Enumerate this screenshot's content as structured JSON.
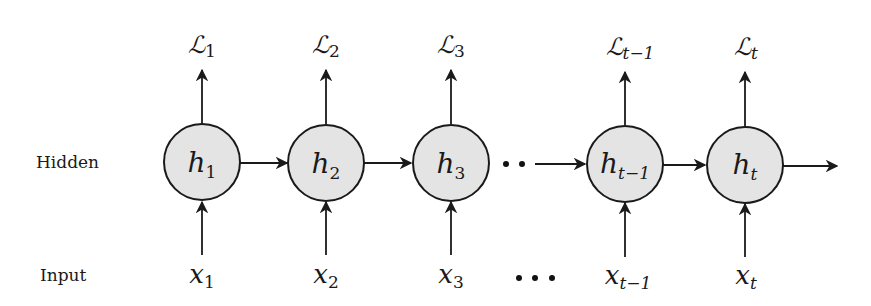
{
  "diagram": {
    "row_labels": {
      "hidden": "Hidden",
      "input": "Input"
    },
    "colors": {
      "node_fill": "#e4e4e4",
      "stroke": "#1a1a1a",
      "background": "#ffffff"
    },
    "nodes": [
      {
        "id": "h1",
        "hidden": {
          "base": "h",
          "sub": "1"
        },
        "input": {
          "base": "x",
          "sub": "1"
        },
        "loss": {
          "base": "ℒ",
          "sub": "1"
        },
        "cx": 202
      },
      {
        "id": "h2",
        "hidden": {
          "base": "h",
          "sub": "2"
        },
        "input": {
          "base": "x",
          "sub": "2"
        },
        "loss": {
          "base": "ℒ",
          "sub": "2"
        },
        "cx": 326
      },
      {
        "id": "h3",
        "hidden": {
          "base": "h",
          "sub": "3"
        },
        "input": {
          "base": "x",
          "sub": "3"
        },
        "loss": {
          "base": "ℒ",
          "sub": "3"
        },
        "cx": 451
      },
      {
        "id": "ht-1",
        "hidden": {
          "base": "h",
          "sub": "t−1"
        },
        "input": {
          "base": "x",
          "sub": "t−1"
        },
        "loss": {
          "base": "ℒ",
          "sub": "t−1"
        },
        "cx": 625
      },
      {
        "id": "ht",
        "hidden": {
          "base": "h",
          "sub": "t"
        },
        "input": {
          "base": "x",
          "sub": "t"
        },
        "loss": {
          "base": "ℒ",
          "sub": "t"
        },
        "cx": 745
      }
    ],
    "ellipsis": {
      "hidden_row": "··",
      "input_row": "···"
    },
    "edges": [
      {
        "from": "h1",
        "to": "h2",
        "type": "recurrent"
      },
      {
        "from": "h2",
        "to": "h3",
        "type": "recurrent"
      },
      {
        "from": "h3",
        "to": "ht-1",
        "type": "recurrent-elided"
      },
      {
        "from": "ht-1",
        "to": "ht",
        "type": "recurrent"
      },
      {
        "from": "ht",
        "to": "out",
        "type": "recurrent-output"
      }
    ]
  }
}
